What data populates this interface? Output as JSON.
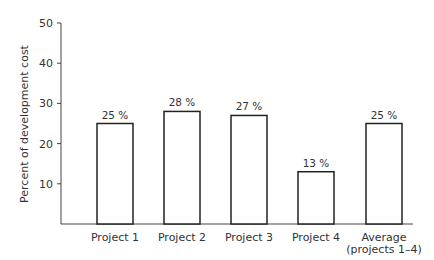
{
  "chart_data": {
    "type": "bar",
    "title": "",
    "xlabel": "",
    "ylabel": "Percent of development cost",
    "ylim": [
      0,
      50
    ],
    "yticks": [
      10,
      20,
      30,
      40,
      50
    ],
    "grid": false,
    "categories": [
      "Project 1",
      "Project 2",
      "Project 3",
      "Project 4",
      "Average (projects 1–4)"
    ],
    "category_lines": [
      [
        "Project 1"
      ],
      [
        "Project 2"
      ],
      [
        "Project 3"
      ],
      [
        "Project 4"
      ],
      [
        "Average",
        "(projects 1–4)"
      ]
    ],
    "values": [
      25,
      28,
      27,
      13,
      25
    ],
    "value_labels": [
      "25 %",
      "28 %",
      "27 %",
      "13 %",
      "25 %"
    ],
    "colors": {
      "bar_fill": "#ffffff",
      "bar_stroke": "#222222",
      "axis": "#444444",
      "text": "#333333"
    }
  }
}
